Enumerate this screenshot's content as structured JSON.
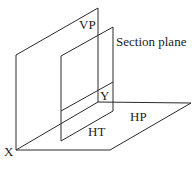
{
  "diagram": {
    "labels": {
      "vp": "VP",
      "section_plane": "Section plane",
      "y": "Y",
      "hp": "HP",
      "ht": "HT",
      "x": "X"
    },
    "colors": {
      "line": "#2a2a2a",
      "text": "#222222",
      "background": "#ffffff"
    }
  }
}
